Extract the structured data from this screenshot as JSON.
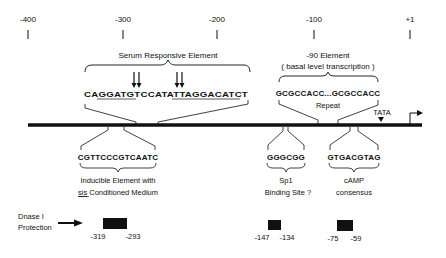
{
  "axis": {
    "ticks": [
      {
        "label": "-400",
        "x": 28
      },
      {
        "label": "-300",
        "x": 123
      },
      {
        "label": "-200",
        "x": 217
      },
      {
        "label": "-100",
        "x": 314
      },
      {
        "label": "+1",
        "x": 410
      }
    ]
  },
  "elements": {
    "serum": {
      "title": "Serum Responsive Element",
      "sequence": "CAGGATGTCCATATTAGGACATCT"
    },
    "inducible": {
      "sequence": "CGTTCCCGTCAATC",
      "label_line1": "Inducible Element with",
      "label_line2_underlined": "sis",
      "label_line2_rest": " Conditioned Medium"
    },
    "minus90": {
      "title": "-90 Element",
      "subtitle": "( basal level transcription )",
      "sequence": "GCGCCACC...GCGCCACC",
      "note": "Repeat"
    },
    "sp1": {
      "sequence": "GGGCGG",
      "label_line1": "Sp1",
      "label_line2": "Binding Site ?"
    },
    "camp": {
      "sequence": "GTGACGTAG",
      "label_line1": "cAMP",
      "label_line2": "consensus"
    },
    "tata": {
      "label": "TATA"
    }
  },
  "dnase": {
    "label_line1": "Dnase I",
    "label_line2": "Protection",
    "regions": [
      {
        "start": "-319",
        "end": "-293"
      },
      {
        "start": "-147",
        "end": "-134"
      },
      {
        "start": "-75",
        "end": "-59"
      }
    ]
  },
  "colors": {
    "ink": "#111111",
    "background": "#ffffff"
  }
}
